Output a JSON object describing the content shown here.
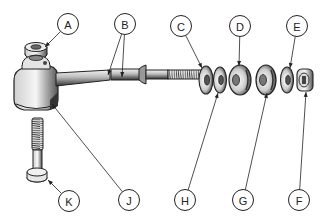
{
  "diagram": {
    "type": "exploded-parts-view",
    "callouts": [
      {
        "id": "A",
        "label": "A",
        "cx": 68,
        "cy": 24,
        "targets": [
          [
            45,
            47
          ]
        ]
      },
      {
        "id": "B",
        "label": "B",
        "cx": 125,
        "cy": 24,
        "targets": [
          [
            108,
            75
          ],
          [
            122,
            77
          ]
        ]
      },
      {
        "id": "C",
        "label": "C",
        "cx": 181,
        "cy": 26,
        "targets": [
          [
            202,
            68
          ]
        ]
      },
      {
        "id": "D",
        "label": "D",
        "cx": 240,
        "cy": 26,
        "targets": [
          [
            239,
            66
          ]
        ]
      },
      {
        "id": "E",
        "label": "E",
        "cx": 297,
        "cy": 26,
        "targets": [
          [
            290,
            68
          ]
        ]
      },
      {
        "id": "F",
        "label": "F",
        "cx": 299,
        "cy": 200,
        "targets": [
          [
            306,
            92
          ]
        ]
      },
      {
        "id": "G",
        "label": "G",
        "cx": 243,
        "cy": 200,
        "targets": [
          [
            267,
            93
          ]
        ]
      },
      {
        "id": "H",
        "label": "H",
        "cx": 185,
        "cy": 200,
        "targets": [
          [
            218,
            93
          ]
        ]
      },
      {
        "id": "J",
        "label": "J",
        "cx": 129,
        "cy": 200,
        "targets": [
          [
            52,
            104
          ]
        ]
      },
      {
        "id": "K",
        "label": "K",
        "cx": 69,
        "cy": 201,
        "targets": [
          [
            48,
            180
          ]
        ]
      }
    ],
    "colors": {
      "ink": "#222222",
      "shade": "#555555",
      "light": "#e8e8e8",
      "background": "#ffffff"
    }
  }
}
